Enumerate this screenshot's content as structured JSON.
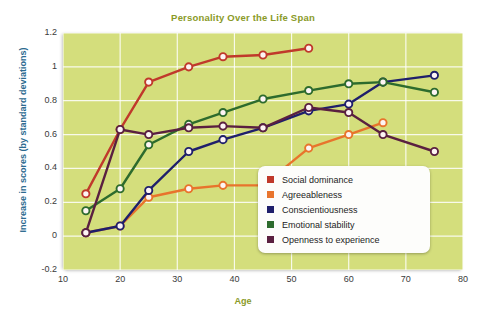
{
  "chart_data": {
    "type": "line",
    "title": "Personality Over the Life Span",
    "xlabel": "Age",
    "ylabel": "Increase in scores (by standard deviations)",
    "xlim": [
      10,
      80
    ],
    "ylim": [
      -0.2,
      1.2
    ],
    "xticks": [
      10,
      20,
      30,
      40,
      50,
      60,
      70,
      80
    ],
    "yticks": [
      -0.2,
      0,
      0.2,
      0.4,
      0.6,
      0.8,
      1,
      1.2
    ],
    "ytick_labels": [
      "-0.2",
      "0",
      "0.2",
      "0.4",
      "0.6",
      "0.8",
      "1",
      "1.2"
    ],
    "grid": true,
    "legend_position": "inside-right-lower",
    "series": [
      {
        "name": "Social dominance",
        "color": "#c0392b",
        "points": [
          {
            "x": 14,
            "y": 0.25
          },
          {
            "x": 20,
            "y": 0.63
          },
          {
            "x": 25,
            "y": 0.91
          },
          {
            "x": 32,
            "y": 1.0
          },
          {
            "x": 38,
            "y": 1.06
          },
          {
            "x": 45,
            "y": 1.07
          },
          {
            "x": 53,
            "y": 1.11
          }
        ]
      },
      {
        "name": "Agreeableness",
        "color": "#e8742c",
        "points": [
          {
            "x": 14,
            "y": 0.02
          },
          {
            "x": 20,
            "y": 0.06
          },
          {
            "x": 25,
            "y": 0.23
          },
          {
            "x": 32,
            "y": 0.28
          },
          {
            "x": 38,
            "y": 0.3
          },
          {
            "x": 45,
            "y": 0.3
          },
          {
            "x": 53,
            "y": 0.52
          },
          {
            "x": 60,
            "y": 0.6
          },
          {
            "x": 66,
            "y": 0.67
          }
        ]
      },
      {
        "name": "Conscientiousness",
        "color": "#1f1f6b",
        "points": [
          {
            "x": 14,
            "y": 0.02
          },
          {
            "x": 20,
            "y": 0.06
          },
          {
            "x": 25,
            "y": 0.27
          },
          {
            "x": 32,
            "y": 0.5
          },
          {
            "x": 38,
            "y": 0.57
          },
          {
            "x": 45,
            "y": 0.64
          },
          {
            "x": 53,
            "y": 0.74
          },
          {
            "x": 60,
            "y": 0.78
          },
          {
            "x": 66,
            "y": 0.91
          },
          {
            "x": 75,
            "y": 0.95
          }
        ]
      },
      {
        "name": "Emotional stability",
        "color": "#2d6b2d",
        "points": [
          {
            "x": 14,
            "y": 0.15
          },
          {
            "x": 20,
            "y": 0.28
          },
          {
            "x": 25,
            "y": 0.54
          },
          {
            "x": 32,
            "y": 0.66
          },
          {
            "x": 38,
            "y": 0.73
          },
          {
            "x": 45,
            "y": 0.81
          },
          {
            "x": 53,
            "y": 0.86
          },
          {
            "x": 60,
            "y": 0.9
          },
          {
            "x": 66,
            "y": 0.91
          },
          {
            "x": 75,
            "y": 0.85
          }
        ]
      },
      {
        "name": "Openness to experience",
        "color": "#5a2040",
        "points": [
          {
            "x": 14,
            "y": 0.02
          },
          {
            "x": 20,
            "y": 0.63
          },
          {
            "x": 25,
            "y": 0.6
          },
          {
            "x": 32,
            "y": 0.64
          },
          {
            "x": 38,
            "y": 0.65
          },
          {
            "x": 45,
            "y": 0.64
          },
          {
            "x": 53,
            "y": 0.76
          },
          {
            "x": 60,
            "y": 0.73
          },
          {
            "x": 66,
            "y": 0.6
          },
          {
            "x": 75,
            "y": 0.5
          }
        ]
      }
    ]
  }
}
